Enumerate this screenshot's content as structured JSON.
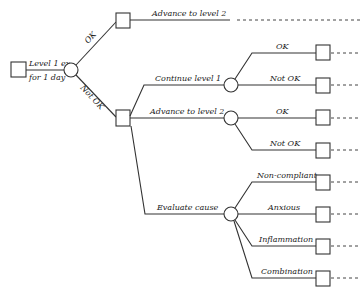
{
  "diagram": {
    "type": "decision-tree",
    "root": {
      "label_line1": "Level 1 ex.",
      "label_line2": "for 1 day",
      "branch_ok": "OK",
      "branch_not_ok": "Not OK"
    },
    "ok_path": {
      "label": "Advance to level 2"
    },
    "not_ok_path": {
      "options": [
        {
          "label": "Continue level 1",
          "outcomes": [
            "OK",
            "Not OK"
          ]
        },
        {
          "label": "Advance to level 2",
          "outcomes": [
            "OK",
            "Not OK"
          ]
        },
        {
          "label": "Evaluate cause",
          "outcomes": [
            "Non-compliant",
            "Anxious",
            "Inflammation",
            "Combination"
          ]
        }
      ]
    }
  }
}
